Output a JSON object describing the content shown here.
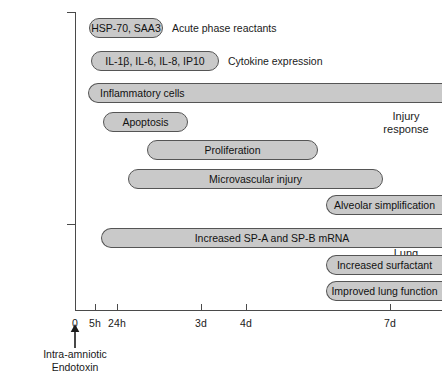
{
  "chart_data": {
    "type": "bar",
    "title": "",
    "xlabel": "",
    "ylabel": "",
    "orientation": "horizontal",
    "subtitle": "Timeline of fetal injury response and lung maturation after intra-amniotic endotoxin",
    "grid": false,
    "legend": "none",
    "x_axis": {
      "ticks": [
        {
          "label": "0",
          "x_px": 75
        },
        {
          "label": "5h",
          "x_px": 95
        },
        {
          "label": "24h",
          "x_px": 117
        },
        {
          "label": "3d",
          "x_px": 201
        },
        {
          "label": "4d",
          "x_px": 246
        },
        {
          "label": "7d",
          "x_px": 390
        }
      ],
      "axis_start_px": 75,
      "axis_end_px": 442
    },
    "sections": [
      {
        "id": "injury-response",
        "label": "Injury\nresponse",
        "line1": "Injury",
        "line2": "response"
      },
      {
        "id": "lung-maturation",
        "label": "Lung\nmaturation",
        "line1": "Lung",
        "line2": "maturation"
      }
    ],
    "bars": [
      {
        "id": "hsp70-saa3",
        "label": "HSP-70, SAA3",
        "annotation": "Acute phase reactants",
        "section": "injury-response",
        "start_px": 89,
        "end_px": 163,
        "top_px": 18,
        "align": "center",
        "open_right": false
      },
      {
        "id": "cytokines",
        "label": "IL-1β, IL-6, IL-8, IP10",
        "annotation": "Cytokine expression",
        "section": "injury-response",
        "start_px": 91,
        "end_px": 219,
        "top_px": 51,
        "align": "center",
        "open_right": false
      },
      {
        "id": "inflammatory-cells",
        "label": "Inflammatory cells",
        "annotation": "",
        "section": "injury-response",
        "start_px": 88,
        "end_px": 442,
        "top_px": 83,
        "align": "left",
        "open_right": true
      },
      {
        "id": "apoptosis",
        "label": "Apoptosis",
        "annotation": "",
        "section": "injury-response",
        "start_px": 103,
        "end_px": 188,
        "top_px": 112,
        "align": "center",
        "open_right": false
      },
      {
        "id": "proliferation",
        "label": "Proliferation",
        "annotation": "",
        "section": "injury-response",
        "start_px": 147,
        "end_px": 318,
        "top_px": 140,
        "align": "center",
        "open_right": false
      },
      {
        "id": "microvascular-injury",
        "label": "Microvascular injury",
        "annotation": "",
        "section": "injury-response",
        "start_px": 128,
        "end_px": 383,
        "top_px": 169,
        "align": "center",
        "open_right": false
      },
      {
        "id": "alveolar-simplification",
        "label": "Alveolar simplification",
        "annotation": "",
        "section": "lung-maturation",
        "start_px": 326,
        "end_px": 442,
        "top_px": 195,
        "align": "center",
        "open_right": true
      },
      {
        "id": "sp-a-sp-b-mrna",
        "label": "Increased SP-A and SP-B mRNA",
        "annotation": "",
        "section": "lung-maturation",
        "start_px": 101,
        "end_px": 442,
        "top_px": 228,
        "align": "center",
        "open_right": true
      },
      {
        "id": "increased-surfactant",
        "label": "Increased surfactant",
        "annotation": "",
        "section": "lung-maturation",
        "start_px": 326,
        "end_px": 442,
        "top_px": 255,
        "align": "center",
        "open_right": true
      },
      {
        "id": "improved-lung-function",
        "label": "Improved lung function",
        "annotation": "",
        "section": "lung-maturation",
        "start_px": 326,
        "end_px": 442,
        "top_px": 281,
        "align": "center",
        "open_right": true
      }
    ],
    "event_marker": {
      "x_px": 75,
      "caption_line1": "Intra-amniotic",
      "caption_line2": "Endotoxin"
    },
    "colors": {
      "bar_fill": "#c9c9c9",
      "bar_stroke": "#555555",
      "axis": "#4a4a4a",
      "text": "#1a1a1a",
      "background": "#ffffff"
    }
  }
}
